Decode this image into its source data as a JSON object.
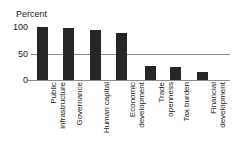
{
  "chart_data": {
    "type": "bar",
    "title": "",
    "xlabel": "",
    "ylabel": "Percent",
    "ylim": [
      0,
      100
    ],
    "yticks": [
      0,
      50,
      100
    ],
    "ytick_labels": [
      "0",
      "50",
      "100"
    ],
    "grid": false,
    "legend": "none",
    "reference_line": {
      "value": 50,
      "label": ""
    },
    "bar_color": "#262626",
    "axis_color": "#8c8c8c",
    "categories": [
      "Public infrastructure",
      "Governance",
      "Human capital",
      "Economic development",
      "Trade openness",
      "Tax burden",
      "Financial development"
    ],
    "category_lines": [
      "Public\ninfrastructure",
      "Governance",
      "Human capital",
      "Economic\ndevelopment",
      "Trade\nopenness",
      "Tax burden",
      "Financial\ndevelopment"
    ],
    "values": [
      100,
      98,
      94,
      89,
      26,
      24,
      15
    ]
  }
}
